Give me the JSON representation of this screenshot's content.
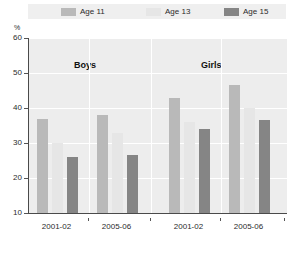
{
  "chart_data": {
    "type": "bar",
    "title": "",
    "xlabel": "",
    "ylabel": "%",
    "ylim": [
      10,
      60
    ],
    "yticks": [
      10,
      20,
      30,
      40,
      50,
      60
    ],
    "grid": true,
    "legend_position": "top",
    "groups": [
      "Boys",
      "Girls"
    ],
    "categories": [
      "2001-02",
      "2005-06",
      "2001-02",
      "2005-06"
    ],
    "series": [
      {
        "name": "Age 11",
        "color": "#b9b9b9",
        "values": [
          37,
          38,
          43,
          46.5
        ]
      },
      {
        "name": "Age 13",
        "color": "#e6e6e6",
        "values": [
          30,
          33,
          36,
          40
        ]
      },
      {
        "name": "Age 15",
        "color": "#858585",
        "values": [
          26,
          26.5,
          34,
          36.5
        ]
      }
    ]
  },
  "legend": {
    "items": [
      {
        "label": "Age 11",
        "swatch": "#b9b9b9"
      },
      {
        "label": "Age 13",
        "swatch": "#e6e6e6"
      },
      {
        "label": "Age 15",
        "swatch": "#858585"
      }
    ]
  },
  "axis": {
    "y_unit": "%",
    "y_labels": [
      "60",
      "50",
      "40",
      "30",
      "20",
      "10"
    ],
    "x_labels": [
      "2001-02",
      "2005-06",
      "2001-02",
      "2005-06"
    ]
  },
  "groups": {
    "boys": "Boys",
    "girls": "Girls"
  },
  "colors": {
    "plot_background": "#ededed",
    "legend_background": "#efefef",
    "gridline": "#ffffff",
    "axis": "#4a4a4a",
    "text": "#2b2b2b"
  }
}
